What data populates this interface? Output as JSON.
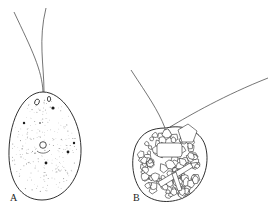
{
  "figure": {
    "panels": [
      {
        "id": "A",
        "label": "A",
        "description": "naked ovoid flagellate cell with two flagella, stippled cytoplasm, vacuoles and granules"
      },
      {
        "id": "B",
        "label": "B",
        "description": "cell enclosed in a test of agglutinated mineral particles with two flagella"
      }
    ]
  }
}
